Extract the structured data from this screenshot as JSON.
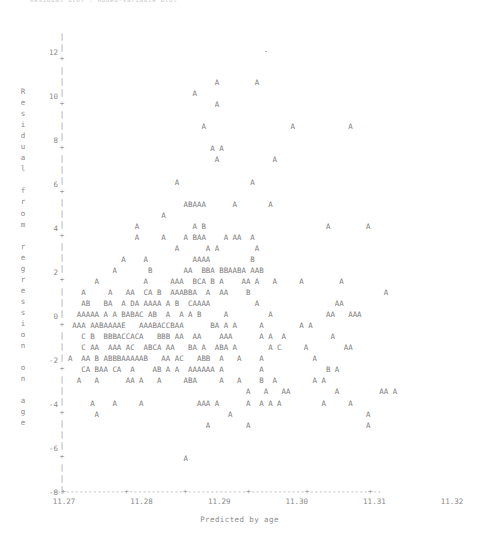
{
  "title": "Residual plot : Added-Variable plot",
  "axes": {
    "ylabel": "Residual from regression on age",
    "xlabel": "Predicted by age",
    "yticks": [
      "12",
      "10",
      "8",
      "6",
      "4",
      "2",
      "0",
      "-2",
      "-4",
      "-6",
      "-8"
    ],
    "xticks": [
      "11.27",
      "11.28",
      "11.29",
      "11.30",
      "11.31",
      "11.32"
    ],
    "tick_glyph": "+",
    "vertical_spine_glyph": "|",
    "horizontal_axis_glyph": "-"
  },
  "legend": {
    "note": "A=1 obs, B=2 obs, C=3 obs, D=4 obs, E=5 obs"
  },
  "colors": {
    "ink": "#7d7d7d",
    "axis": "#9a9a9a",
    "label": "#8a8a8a",
    "background": "#ffffff"
  },
  "chart_data": {
    "type": "scatter",
    "title": "Residual plot : Added-Variable plot",
    "xlabel": "Predicted by age",
    "ylabel": "Residual from regression on age",
    "xlim": [
      11.265,
      11.325
    ],
    "ylim": [
      -9,
      13
    ],
    "xtick_values": [
      11.27,
      11.28,
      11.29,
      11.3,
      11.31,
      11.32
    ],
    "ytick_values": [
      12,
      10,
      8,
      6,
      4,
      2,
      0,
      -2,
      -4,
      -6,
      -8
    ],
    "grid": false,
    "legend_position": "none",
    "encoding": "Each plotted character encodes overlapping point count: A=1, B=2, C=3, D=4, E=5",
    "rows": [
      "                                              .                                    ",
      "                                                                                   ",
      "                                                                                   ",
      "                                   A        A                                      ",
      "                              A                                                    ",
      "                                   A                                               ",
      "                                                                                   ",
      "                                A                   A            A                 ",
      "                                                                                   ",
      "                                  A A                                              ",
      "                                   A            A                                  ",
      "                                                                                   ",
      "                          A                A                                       ",
      "                                                                                   ",
      "                            ABAAA      A       A                                   ",
      "                       A                                                           ",
      "                 A            A B                           A        A             ",
      "                 A     A    A BAA    A AA  A                                       ",
      "                          A      A A        A                                      ",
      "              A    A          AAAA         B                                       ",
      "            A       B       AA  BBA BBAABA AAB                                     ",
      "        A          A     AAA  BCA B A    AA A   A     A        A                   ",
      "     A     A   AA  CA B  AAABBA  A  AA    B                              A         ",
      "     AB   BA  A DA AAAA A B  CAAAA          A                 AA                   ",
      "    AAAAA A A BABAC AB  A  A A B     A         A            AA   AAA               ",
      "   AAA AABAAAAE   AAABACCBAA      BA A A     A        A A                          ",
      "     C B  BBBACCACA   BBB AA  AA    AAA      A A  A          A                     ",
      "     C AA  AAA AC  ABCA AA   BA A  ABA A       A C     A        AA                 ",
      "  A  AA B ABBBAAAAAB   AA AC   ABB  A   A    A           A                         ",
      "     CA BAA CA  A    AB A A  AAAAAA A        A              B A                    ",
      "    A   A      AA A   A     ABA     A   A    B  A        A A                       ",
      "                                          A   A   AA          A         AA A       ",
      "       A    A     A            AAA A      A  A A A         A     A                 ",
      "        A                             A                              A             ",
      "                                 A        A                          A             ",
      "                                                                                   ",
      "                                                                                   ",
      "                            A                                                      ",
      "                                                                                   ",
      "                                                                                   "
    ]
  }
}
